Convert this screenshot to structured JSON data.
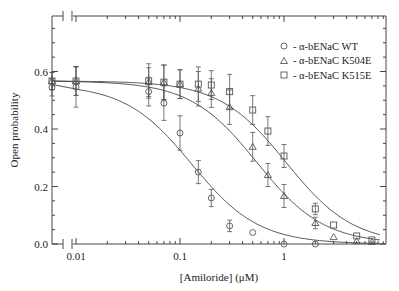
{
  "chart_data": {
    "type": "scatter",
    "title": "",
    "xlabel": "[Amiloride] (μM)",
    "ylabel": "Open probability",
    "x_scale": "log",
    "x_axis_break": true,
    "xlim": [
      0.006,
      9.5
    ],
    "ylim": [
      0.0,
      0.79
    ],
    "x_ticks": [
      0.01,
      0.1,
      1
    ],
    "x_tick_labels": [
      "0.01",
      "0.1",
      "1"
    ],
    "y_ticks": [
      0.0,
      0.2,
      0.4,
      0.6
    ],
    "y_tick_labels": [
      "0.0",
      "0.2",
      "0.4",
      "0.6"
    ],
    "grid": false,
    "legend_position": "upper right",
    "series": [
      {
        "name": "α-bENaC WT",
        "marker": "circle",
        "x": [
          0,
          0.01,
          0.05,
          0.07,
          0.1,
          0.15,
          0.2,
          0.3,
          0.5,
          1,
          2
        ],
        "y": [
          0.545,
          0.546,
          0.53,
          0.49,
          0.386,
          0.25,
          0.16,
          0.063,
          0.04,
          0.0,
          0.0
        ],
        "err": [
          0.03,
          0.07,
          0.05,
          0.06,
          0.06,
          0.04,
          0.03,
          0.02,
          0.0,
          0.0,
          0.0
        ],
        "fit_ic50": 0.13,
        "fit_max": 0.555
      },
      {
        "name": "α-bENaC K504E",
        "marker": "triangle",
        "x": [
          0,
          0.01,
          0.05,
          0.07,
          0.1,
          0.15,
          0.2,
          0.3,
          0.5,
          0.7,
          1,
          2,
          3,
          5,
          7
        ],
        "y": [
          0.567,
          0.567,
          0.563,
          0.562,
          0.556,
          0.54,
          0.525,
          0.476,
          0.338,
          0.24,
          0.167,
          0.073,
          0.024,
          0.01,
          0.007
        ],
        "err": [
          0.03,
          0.05,
          0.05,
          0.06,
          0.05,
          0.06,
          0.05,
          0.06,
          0.05,
          0.04,
          0.04,
          0.02,
          0.0,
          0.0,
          0.0
        ],
        "fit_ic50": 0.55,
        "fit_max": 0.567
      },
      {
        "name": "α-bENaC K515E",
        "marker": "square",
        "x": [
          0,
          0.01,
          0.05,
          0.07,
          0.1,
          0.15,
          0.2,
          0.3,
          0.5,
          0.7,
          1,
          2,
          3,
          5,
          7
        ],
        "y": [
          0.567,
          0.567,
          0.567,
          0.563,
          0.556,
          0.556,
          0.553,
          0.53,
          0.466,
          0.393,
          0.306,
          0.122,
          0.066,
          0.028,
          0.014
        ],
        "err": [
          0.03,
          0.05,
          0.06,
          0.06,
          0.05,
          0.06,
          0.05,
          0.06,
          0.05,
          0.05,
          0.04,
          0.02,
          0.0,
          0.0,
          0.0
        ],
        "fit_ic50": 1.05,
        "fit_max": 0.567
      }
    ],
    "legend": [
      {
        "marker": "circle",
        "label": "- α-bENaC WT"
      },
      {
        "marker": "triangle",
        "label": "- α-bENaC K504E"
      },
      {
        "marker": "square",
        "label": "- α-bENaC K515E"
      }
    ]
  },
  "axes": {
    "xlabel": "[Amiloride] (μM)",
    "ylabel": "Open probability"
  },
  "legend": {
    "items": [
      {
        "label": "- α-bENaC WT"
      },
      {
        "label": "- α-bENaC K504E"
      },
      {
        "label": "- α-bENaC K515E"
      }
    ]
  },
  "style": {
    "line_color": "#444444",
    "marker_color": "#555555",
    "axis_color": "#333333"
  }
}
